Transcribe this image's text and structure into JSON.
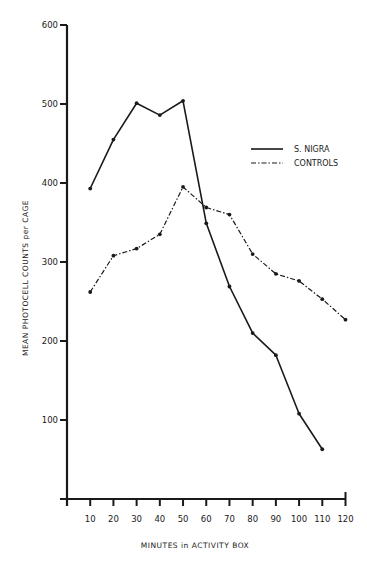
{
  "chart_data": {
    "type": "line",
    "title": "",
    "xlabel": "MINUTES in ACTIVITY BOX",
    "ylabel": "MEAN PHOTOCELL COUNTS per CAGE",
    "x": [
      10,
      20,
      30,
      40,
      50,
      60,
      70,
      80,
      90,
      100,
      110,
      120
    ],
    "xticks": [
      10,
      20,
      30,
      40,
      50,
      60,
      70,
      80,
      90,
      100,
      110,
      120
    ],
    "yticks": [
      100,
      200,
      300,
      400,
      500,
      600
    ],
    "xlim": [
      0,
      120
    ],
    "ylim": [
      0,
      600
    ],
    "grid": false,
    "legend_position": "upper right",
    "series": [
      {
        "name": "S. NIGRA",
        "style": "solid",
        "x": [
          10,
          20,
          30,
          40,
          50,
          60,
          70,
          80,
          90,
          100,
          110
        ],
        "values": [
          393,
          455,
          501,
          486,
          504,
          349,
          269,
          210,
          182,
          108,
          63
        ]
      },
      {
        "name": "CONTROLS",
        "style": "dash-dot",
        "x": [
          10,
          20,
          30,
          40,
          50,
          60,
          70,
          80,
          90,
          100,
          110,
          120
        ],
        "values": [
          262,
          308,
          317,
          335,
          395,
          369,
          360,
          310,
          285,
          276,
          253,
          227
        ]
      }
    ]
  },
  "colors": {
    "ink": "#1a1a1a",
    "background": "#ffffff"
  }
}
